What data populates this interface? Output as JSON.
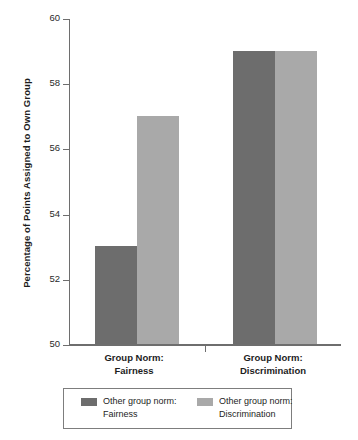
{
  "chart_data": {
    "type": "bar",
    "title": "",
    "subtitle": "",
    "xlabel": "",
    "ylabel": "Percentage of Points Assigned to Own Group",
    "ylim": [
      50,
      60
    ],
    "yticks": [
      50,
      52,
      54,
      56,
      58,
      60
    ],
    "ytick_labels": [
      "50",
      "52",
      "54",
      "56",
      "58",
      "60"
    ],
    "grid": false,
    "legend_position": "bottom",
    "categories": [
      "Group Norm: Fairness",
      "Group Norm: Discrimination"
    ],
    "category_lines": [
      [
        "Group Norm:",
        "Fairness"
      ],
      [
        "Group Norm:",
        "Discrimination"
      ]
    ],
    "series": [
      {
        "name": "Other group norm: Fairness",
        "name_lines": [
          "Other group norm:",
          "Fairness"
        ],
        "color": "#6d6d6d",
        "values": [
          53,
          59
        ]
      },
      {
        "name": "Other group norm: Discrimination",
        "name_lines": [
          "Other group norm:",
          "Discrimination"
        ],
        "color": "#a9a9a9",
        "values": [
          57,
          59
        ]
      }
    ],
    "annotations": []
  },
  "colors": {
    "axis": "#6e6e6e",
    "text": "#1d1d1d",
    "background": "#ffffff",
    "legend_border": "#7d7d7d"
  }
}
